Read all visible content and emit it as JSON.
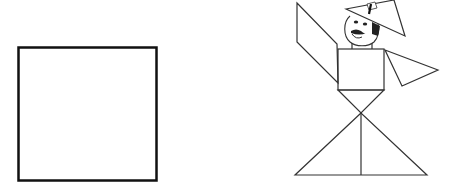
{
  "figure": {
    "left_panel": {
      "shape": "square",
      "stroke": "#111111"
    },
    "right_panel": {
      "subject": "tangram figure of a person wearing a hat",
      "hat_label": "1",
      "stroke": "#333333"
    }
  }
}
